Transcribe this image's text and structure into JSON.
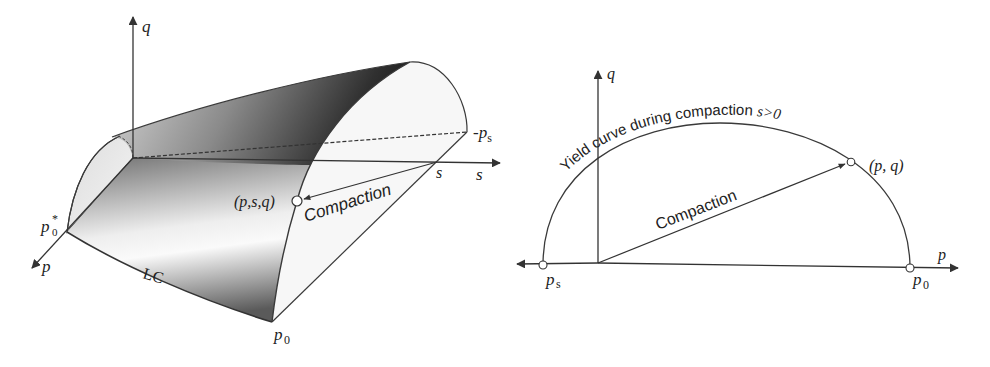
{
  "figure": {
    "left_panel": {
      "name": "3D yield surface in p-s-q space",
      "axes": {
        "q": "q",
        "s": "s",
        "p": "p"
      },
      "labels": {
        "p0_star_base": "p",
        "p0_star_sub": "0",
        "p0_star_sup": "*",
        "p0_base": "p",
        "p0_sub": "0",
        "neg_ps_prefix": "-",
        "neg_ps_base": "p",
        "neg_ps_sub": "s",
        "s_tick": "s",
        "lc_curve": "LC",
        "stress_point": "(p,s,q)",
        "compaction_arrow": "Compaction"
      }
    },
    "right_panel": {
      "name": "Yield curve in p-q plane",
      "axes": {
        "q": "q",
        "p": "p"
      },
      "labels": {
        "yield_curve": "Yield curve during compaction ",
        "yield_condition": "s>0",
        "stress_point": "(p, q)",
        "compaction_arrow": "Compaction",
        "ps_base": "p",
        "ps_sub": "s",
        "p0_base": "p",
        "p0_sub": "0"
      }
    },
    "colors": {
      "line": "#3a3a3a",
      "text": "#222222",
      "surface_dark": "#1e1e1e",
      "surface_mid": "#8a8a8a",
      "surface_light": "#f4f4f4",
      "background": "#ffffff"
    }
  }
}
